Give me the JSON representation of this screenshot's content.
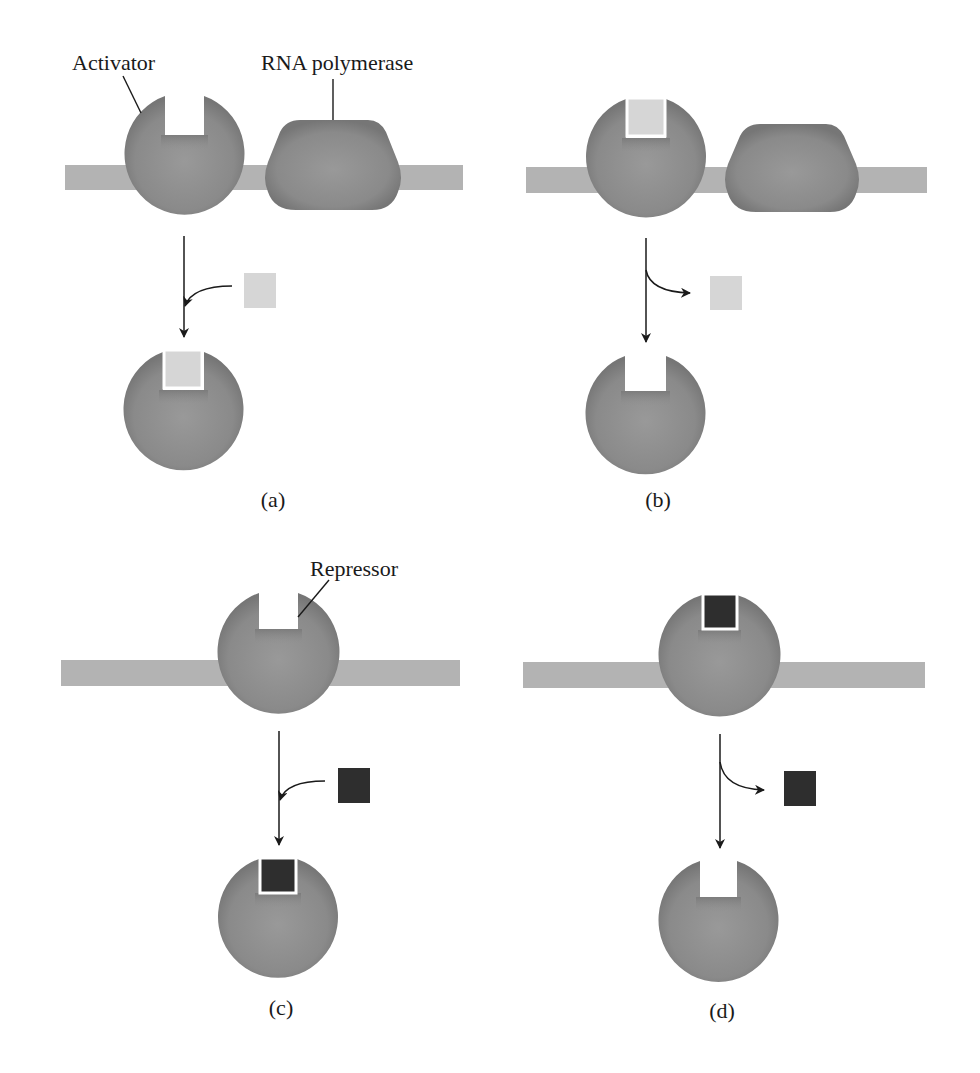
{
  "figure": {
    "labels": {
      "activator": "Activator",
      "rna_polymerase": "RNA polymerase",
      "repressor": "Repressor"
    },
    "panels": [
      {
        "id": "a",
        "label": "(a)",
        "protein": "Activator",
        "ligand": "light",
        "event": "ligand binds; activator leaves DNA"
      },
      {
        "id": "b",
        "label": "(b)",
        "protein": "Activator",
        "ligand": "light",
        "event": "ligand released; activator leaves DNA"
      },
      {
        "id": "c",
        "label": "(c)",
        "protein": "Repressor",
        "ligand": "dark",
        "event": "ligand binds; repressor leaves DNA"
      },
      {
        "id": "d",
        "label": "(d)",
        "protein": "Repressor",
        "ligand": "dark",
        "event": "ligand released; repressor leaves DNA"
      }
    ],
    "colors": {
      "protein": "#8c8c8c",
      "protein_shade": "#7a7a7a",
      "dna": "#b3b3b3",
      "light_ligand": "#d6d6d6",
      "dark_ligand": "#2e2e2e",
      "line": "#1a1a1a"
    }
  }
}
